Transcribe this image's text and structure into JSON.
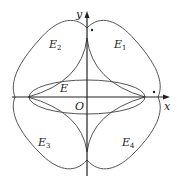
{
  "figure": {
    "axis_labels": {
      "x": "x",
      "y": "y",
      "origin": "O"
    },
    "regions": {
      "E": "E",
      "E1": "E",
      "E1_sub": "1",
      "E2": "E",
      "E2_sub": "2",
      "E3": "E",
      "E3_sub": "3",
      "E4": "E",
      "E4_sub": "4"
    },
    "colors": {
      "curve": "#555555",
      "axis": "#222222",
      "background": "#ffffff"
    }
  }
}
